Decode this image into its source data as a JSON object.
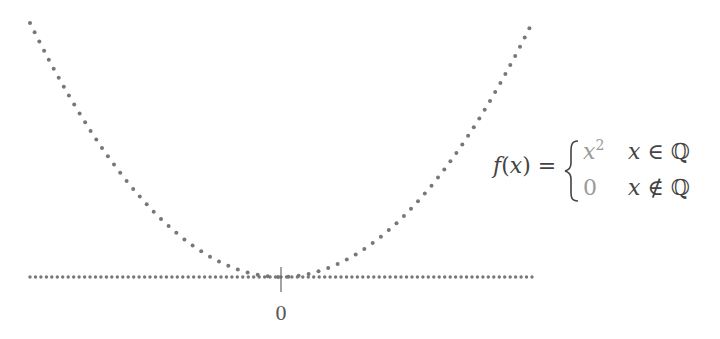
{
  "diagram": {
    "function": {
      "lhs": "f(x) = ",
      "cases": [
        {
          "value": "x",
          "value_sup": "2",
          "condition": "x ∈ ℚ"
        },
        {
          "value": "0",
          "value_sup": "",
          "condition": "x ∉ ℚ"
        }
      ]
    },
    "axis": {
      "tick_label": "0"
    },
    "curves": [
      {
        "name": "parabola-rationals",
        "expr": "y = x^2",
        "style": "dotted",
        "x_range": [
          -1,
          1
        ]
      },
      {
        "name": "zero-line-irrationals",
        "expr": "y = 0",
        "style": "dotted",
        "x_range": [
          -1,
          1
        ]
      }
    ],
    "colors": {
      "dots": "#777777",
      "text": "#444444",
      "case_values": "#9a9a9a"
    }
  }
}
